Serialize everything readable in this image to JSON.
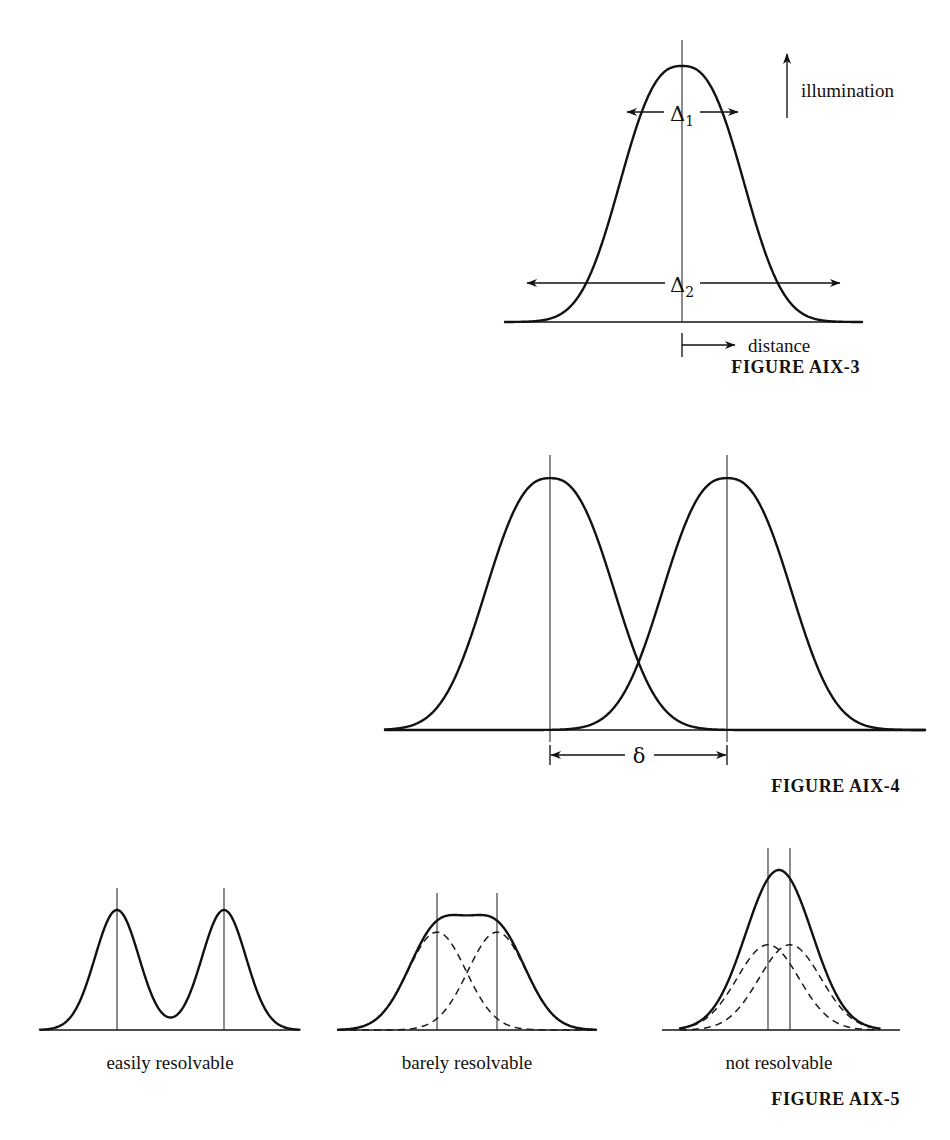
{
  "page": {
    "width": 950,
    "height": 1140,
    "background": "#ffffff",
    "ink": "#14110f"
  },
  "figures": [
    {
      "id": "aix-3",
      "caption": "FIGURE AIX-3",
      "caption_x": 860,
      "caption_y": 373,
      "axis_label_y": "illumination",
      "axis_label_x": "distance",
      "dimension_labels": [
        {
          "name": "delta-1",
          "text": "Δ",
          "subscript": "1"
        },
        {
          "name": "delta-2",
          "text": "Δ",
          "subscript": "2"
        }
      ]
    },
    {
      "id": "aix-4",
      "caption": "FIGURE AIX-4",
      "caption_x": 760,
      "caption_y": 792,
      "separation_label": "δ"
    },
    {
      "id": "aix-5",
      "caption": "FIGURE AIX-5",
      "caption_x": 815,
      "caption_y": 1104,
      "panels": [
        {
          "name": "easily-resolvable",
          "label": "easily resolvable",
          "label_x": 170,
          "label_y": 1068
        },
        {
          "name": "barely-resolvable",
          "label": "barely resolvable",
          "label_x": 467,
          "label_y": 1068
        },
        {
          "name": "not-resolvable",
          "label": "not resolvable",
          "label_x": 779,
          "label_y": 1068
        }
      ]
    }
  ],
  "chart_data": {
    "type": "line",
    "xlabel": "distance",
    "ylabel": "illumination",
    "grid": false,
    "legend": "none",
    "panels": [
      {
        "id": "aix-3",
        "name": "single-diffraction-peak",
        "description": "Single illumination peak showing width measures delta-1 at the top and delta-2 near the base",
        "baseline_y": 322,
        "apex_y": 66,
        "x_range": [
          505,
          862
        ],
        "peaks": [
          {
            "center": 682,
            "amplitude": 256,
            "sigma": 52,
            "flatness": 2.6
          }
        ],
        "annotations": [
          {
            "name": "delta-1",
            "label": "Δ₁",
            "kind": "double-arrow",
            "y": 112,
            "x_left": 627,
            "x_right": 738,
            "label_x": 682,
            "label_y": 120
          },
          {
            "name": "delta-2",
            "label": "Δ₂",
            "kind": "double-arrow",
            "y": 283,
            "x_left": 527,
            "x_right": 840,
            "label_x": 682,
            "label_y": 291
          },
          {
            "name": "illumination-axis-arrow",
            "label": "illumination",
            "kind": "up-arrow",
            "x": 787,
            "y_bottom": 118,
            "y_top": 52,
            "label_x": 800,
            "label_y": 95
          },
          {
            "name": "distance-axis-arrow",
            "label": "distance",
            "kind": "right-arrow",
            "y": 345,
            "x_start": 682,
            "x_end": 735,
            "label_x": 746,
            "label_y": 352
          }
        ]
      },
      {
        "id": "aix-4",
        "name": "two-separated-peaks",
        "description": "Two equal illumination peaks separated by delta, crossing low near the baseline",
        "baseline_y": 730,
        "apex_y": 478,
        "x_range": [
          385,
          925
        ],
        "peaks": [
          {
            "center": 550,
            "amplitude": 252,
            "sigma": 55,
            "flatness": 2.5
          },
          {
            "center": 727,
            "amplitude": 252,
            "sigma": 55,
            "flatness": 2.5
          }
        ],
        "annotations": [
          {
            "name": "delta-separation",
            "label": "δ",
            "kind": "double-arrow",
            "y": 755,
            "x_left": 550,
            "x_right": 727,
            "label_x": 639,
            "label_y": 762
          }
        ]
      },
      {
        "id": "aix-5-panel-1",
        "name": "easily-resolvable",
        "description": "Two narrow peaks well separated; summed curve dips to the baseline between them",
        "baseline_y": 1030,
        "apex_y": 910,
        "x_range": [
          40,
          300
        ],
        "show_components": false,
        "peaks": [
          {
            "center": 117,
            "amplitude": 120,
            "sigma": 22,
            "flatness": 2.0
          },
          {
            "center": 224,
            "amplitude": 120,
            "sigma": 22,
            "flatness": 2.0
          }
        ]
      },
      {
        "id": "aix-5-panel-2",
        "name": "barely-resolvable",
        "description": "Two overlapping dashed component peaks whose solid sum shows a shallow central dip",
        "baseline_y": 1030,
        "apex_y": 915,
        "x_range": [
          338,
          596
        ],
        "show_components": true,
        "peaks": [
          {
            "center": 437,
            "amplitude": 108,
            "sigma": 29,
            "flatness": 2.0
          },
          {
            "center": 497,
            "amplitude": 108,
            "sigma": 29,
            "flatness": 2.0
          }
        ]
      },
      {
        "id": "aix-5-panel-3",
        "name": "not-resolvable",
        "description": "Two closely spaced dashed component peaks whose solid sum forms a single broad maximum",
        "baseline_y": 1030,
        "apex_y": 870,
        "x_range": [
          680,
          880
        ],
        "show_components": true,
        "peaks": [
          {
            "center": 768,
            "amplitude": 103,
            "sigma": 31,
            "flatness": 2.0
          },
          {
            "center": 790,
            "amplitude": 103,
            "sigma": 31,
            "flatness": 2.0
          }
        ]
      }
    ]
  }
}
